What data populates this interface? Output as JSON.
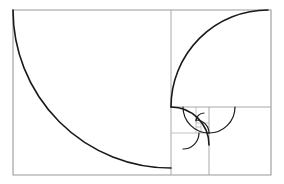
{
  "figure": {
    "title": "Fibonacci golden spiral",
    "background_color": "#ffffff",
    "grid_color": "#a8a8a8",
    "spiral_color": "#1a1a1a",
    "caption": ""
  },
  "chart_data": {
    "type": "diagram",
    "title": "Fibonacci golden spiral",
    "xlabel": "",
    "ylabel": "",
    "bounds": {
      "x": 13,
      "y": 10,
      "width": 258,
      "height": 165
    },
    "squares": [
      {
        "index": 1,
        "fib": 34,
        "x": 13,
        "y": 10,
        "size": 158,
        "corner": "top-right"
      },
      {
        "index": 2,
        "fib": 21,
        "x": 171,
        "y": 10,
        "size": 97,
        "corner": "bottom-right"
      },
      {
        "index": 3,
        "fib": 13,
        "x": 171,
        "y": 107,
        "size": 38,
        "corner": "bottom-left"
      },
      {
        "index": 4,
        "fib": 8,
        "x": 209,
        "y": 107,
        "size": 26,
        "corner": "top-left"
      },
      {
        "index": 5,
        "fib": 5,
        "x": 183,
        "y": 107,
        "size": 26,
        "corner": "top-right"
      },
      {
        "index": 6,
        "fib": 3,
        "x": 183,
        "y": 133,
        "size": 16,
        "corner": "top-left"
      },
      {
        "index": 7,
        "fib": 2,
        "x": 196,
        "y": 120,
        "size": 13,
        "corner": "bottom-left"
      },
      {
        "index": 8,
        "fib": 1,
        "x": 196,
        "y": 113,
        "size": 8,
        "corner": "bottom-right"
      }
    ],
    "arcs": [
      {
        "index": 1,
        "from": [
          171,
          10
        ],
        "to": [
          13,
          175
        ],
        "radius": 158
      },
      {
        "index": 2,
        "from": [
          271,
          107
        ],
        "to": [
          171,
          10
        ],
        "radius": 97
      },
      {
        "index": 3,
        "from": [
          209,
          175
        ],
        "to": [
          271,
          107
        ],
        "radius": 68
      },
      {
        "index": 4,
        "from": [
          171,
          133
        ],
        "to": [
          209,
          175
        ],
        "radius": 38
      },
      {
        "index": 5,
        "from": [
          196,
          107
        ],
        "to": [
          171,
          133
        ],
        "radius": 26
      },
      {
        "index": 6,
        "from": [
          209,
          123
        ],
        "to": [
          196,
          107
        ],
        "radius": 16
      },
      {
        "index": 7,
        "from": [
          201,
          133
        ],
        "to": [
          209,
          123
        ],
        "radius": 10
      },
      {
        "index": 8,
        "from": [
          196,
          127
        ],
        "to": [
          201,
          133
        ],
        "radius": 6
      }
    ],
    "grid_lines": [
      {
        "name": "outer-rect",
        "x1": 13,
        "y1": 10,
        "x2": 271,
        "y2": 175
      },
      {
        "name": "vertical-split-main",
        "x1": 171,
        "y1": 10,
        "x2": 171,
        "y2": 175
      },
      {
        "name": "horizontal-split-2",
        "x1": 171,
        "y1": 107,
        "x2": 271,
        "y2": 107
      },
      {
        "name": "vertical-split-3",
        "x1": 209,
        "y1": 107,
        "x2": 209,
        "y2": 175
      },
      {
        "name": "horizontal-split-4",
        "x1": 171,
        "y1": 133,
        "x2": 209,
        "y2": 133
      },
      {
        "name": "vertical-split-5",
        "x1": 196,
        "y1": 107,
        "x2": 196,
        "y2": 133
      },
      {
        "name": "horizontal-split-6",
        "x1": 196,
        "y1": 123,
        "x2": 209,
        "y2": 123
      },
      {
        "name": "vertical-split-7",
        "x1": 201,
        "y1": 123,
        "x2": 201,
        "y2": 133
      },
      {
        "name": "horizontal-split-8",
        "x1": 196,
        "y1": 127,
        "x2": 201,
        "y2": 127
      }
    ]
  }
}
